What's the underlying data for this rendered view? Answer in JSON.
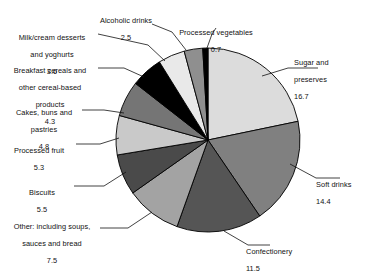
{
  "chart_data": {
    "type": "pie",
    "title": "",
    "subtitle": "",
    "xlabel": "",
    "ylabel": "",
    "legend_position": "none",
    "grid": false,
    "units": "percent",
    "start_angle_deg": 0,
    "direction": "clockwise",
    "categories": [
      "Sugar and preserves",
      "Soft drinks",
      "Confectionery",
      "Other: including soups, sauces and bread",
      "Biscuits",
      "Processed fruit",
      "Cakes, buns and pastries",
      "Breakfast cereals and other cereal-based products",
      "Milk/cream desserts and yoghurts",
      "Alcoholic drinks",
      "Processed vegetables"
    ],
    "values": [
      16.7,
      14.4,
      11.5,
      7.5,
      5.5,
      5.3,
      4.8,
      4.3,
      3.6,
      2.5,
      0.7
    ],
    "colors": [
      "#dcdcdc",
      "#808080",
      "#555555",
      "#a3a3a3",
      "#4a4a4a",
      "#c9c9c9",
      "#757575",
      "#000000",
      "#e9e9e9",
      "#8f8f8f",
      "#000000"
    ],
    "slice_stroke": "#000000"
  },
  "slices": [
    {
      "name": "Sugar and preserves",
      "label_line1": "Sugar and",
      "label_line2": "preserves",
      "value": "16.7",
      "color": "#dcdcdc"
    },
    {
      "name": "Soft drinks",
      "label_line1": "Soft drinks",
      "label_line2": "",
      "value": "14.4",
      "color": "#808080"
    },
    {
      "name": "Confectionery",
      "label_line1": "Confectionery",
      "label_line2": "",
      "value": "11.5",
      "color": "#555555"
    },
    {
      "name": "Other: including soups, sauces and bread",
      "label_line1": "Other: including soups,",
      "label_line2": "sauces and bread",
      "value": "7.5",
      "color": "#a3a3a3"
    },
    {
      "name": "Biscuits",
      "label_line1": "Biscuits",
      "label_line2": "",
      "value": "5.5",
      "color": "#4a4a4a"
    },
    {
      "name": "Processed fruit",
      "label_line1": "Processed fruit",
      "label_line2": "",
      "value": "5.3",
      "color": "#c9c9c9"
    },
    {
      "name": "Cakes, buns and pastries",
      "label_line1": "Cakes, buns and",
      "label_line2": "pastries",
      "value": "4.8",
      "color": "#757575"
    },
    {
      "name": "Breakfast cereals and other cereal-based products",
      "label_line1": "Breakfast cereals and",
      "label_line2": "other cereal-based",
      "label_line3": "products",
      "value": "4.3",
      "color": "#000000"
    },
    {
      "name": "Milk/cream desserts and yoghurts",
      "label_line1": "Milk/cream desserts",
      "label_line2": "and yoghurts",
      "value": "3.6",
      "color": "#e9e9e9"
    },
    {
      "name": "Alcoholic drinks",
      "label_line1": "Alcoholic drinks",
      "label_line2": "",
      "value": "2.5",
      "color": "#8f8f8f"
    },
    {
      "name": "Processed vegetables",
      "label_line1": "Processed vegetables",
      "label_line2": "",
      "value": "0.7",
      "color": "#000000"
    }
  ]
}
